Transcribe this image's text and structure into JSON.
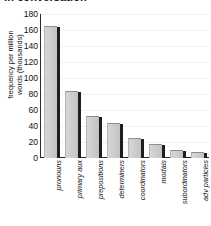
{
  "figure": {
    "title_partial": "in conversation",
    "ylabel_line1": "frequency per million",
    "ylabel_line2": "words (thousands)"
  },
  "axis": {
    "yticks": [
      "180",
      "160",
      "140",
      "120",
      "100",
      "80",
      "60",
      "40",
      "20",
      "0"
    ]
  },
  "colors": {
    "bar_fill": "#cfcfcf",
    "bar_edge": "#1e1e1e",
    "axis": "#2a2a2a",
    "gridline": "#f0f0f0",
    "text": "#111111",
    "background": "#ffffff"
  },
  "chart_data": {
    "type": "bar",
    "title": "in conversation",
    "xlabel": "",
    "ylabel": "frequency per million words (thousands)",
    "ylim": [
      0,
      180
    ],
    "yticks": [
      0,
      20,
      40,
      60,
      80,
      100,
      120,
      140,
      160,
      180
    ],
    "grid": true,
    "legend": "none",
    "categories": [
      "pronouns",
      "primary aux",
      "prepositions",
      "determiners",
      "coordinators",
      "modals",
      "subordinators",
      "adv particles"
    ],
    "values": [
      165,
      84,
      52,
      44,
      25,
      17,
      10,
      7
    ]
  }
}
